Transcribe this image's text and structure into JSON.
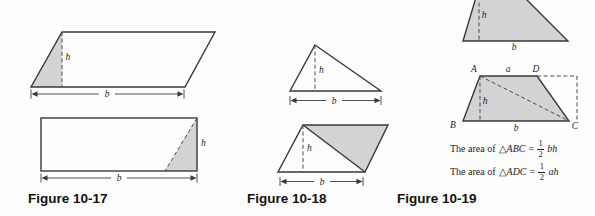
{
  "colors": {
    "background": "#fdfdfd",
    "shape_fill": "#d3d3d3",
    "shape_stroke": "#383838",
    "dashed_stroke": "#4a4a4a",
    "text": "#1f1f1f"
  },
  "fig17": {
    "caption": "Figure 10-17",
    "parallelogram": {
      "height_label": "h",
      "base_label": "b"
    },
    "rectangle": {
      "height_label": "h",
      "base_label": "b"
    }
  },
  "fig18": {
    "caption": "Figure 10-18",
    "triangle": {
      "height_label": "h",
      "base_label": "b"
    },
    "parallelogram": {
      "height_label": "h",
      "base_label": "b"
    }
  },
  "fig19": {
    "caption": "Figure 10-19",
    "top_trapezoid": {
      "height_label": "h",
      "base_label": "b"
    },
    "bottom_trapezoid": {
      "vertex_a": "A",
      "vertex_b": "B",
      "vertex_c": "C",
      "vertex_d": "D",
      "top_label": "a",
      "base_label": "b",
      "height_label": "h"
    },
    "formula_abc": {
      "prefix": "The area of",
      "triangle": "△",
      "name": "ABC",
      "equals": "=",
      "numerator": "1",
      "denominator": "2",
      "tail": "bh"
    },
    "formula_adc": {
      "prefix": "The area of",
      "triangle": "△",
      "name": "ADC",
      "equals": "=",
      "numerator": "1",
      "denominator": "2",
      "tail": "ah"
    }
  }
}
